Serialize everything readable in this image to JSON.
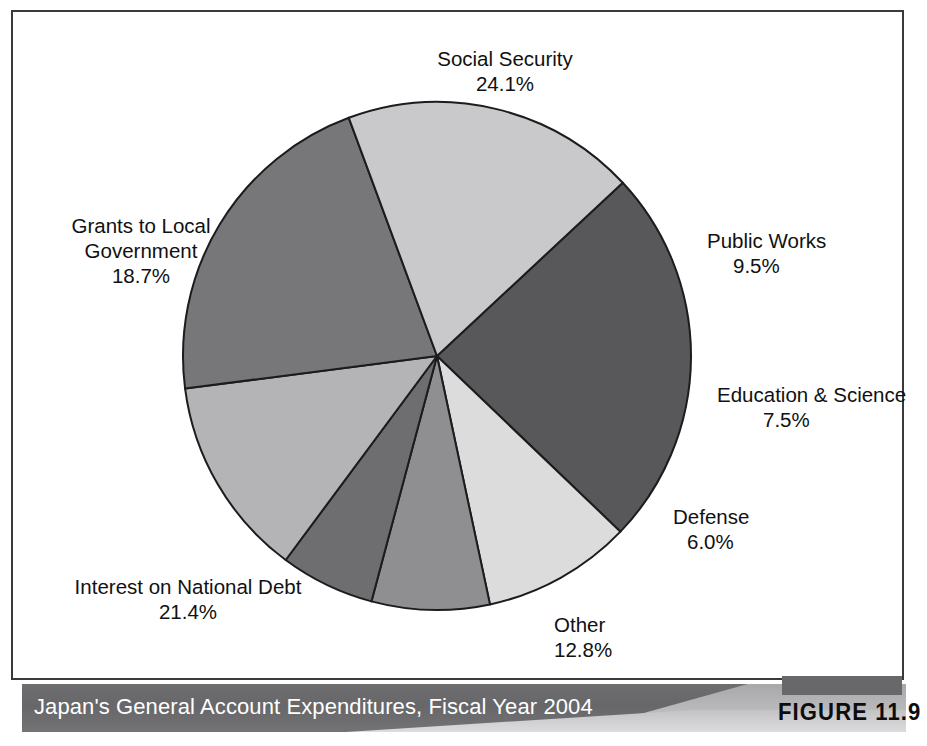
{
  "caption": {
    "title": "Japan's General Account Expenditures, Fiscal Year 2004",
    "figure_number": "FIGURE 11.9"
  },
  "labels": {
    "social_security": {
      "name": "Social Security",
      "pct": "24.1%"
    },
    "public_works": {
      "name": "Public Works",
      "pct": "9.5%"
    },
    "education": {
      "name": "Education & Science",
      "pct": "7.5%"
    },
    "defense": {
      "name": "Defense",
      "pct": "6.0%"
    },
    "other": {
      "name": "Other",
      "pct": "12.8%"
    },
    "interest": {
      "name": "Interest on National Debt",
      "pct": "21.4%"
    },
    "grants_line1": "Grants to Local",
    "grants_line2": "Government",
    "grants_pct": "18.7%"
  },
  "chart_data": {
    "type": "pie",
    "title": "Japan's General Account Expenditures, Fiscal Year 2004",
    "unit": "percent",
    "start_angle_deg": -43,
    "direction": "clockwise",
    "legend": "none-labels-outside",
    "categories": [
      "Social Security",
      "Public Works",
      "Education & Science",
      "Defense",
      "Other",
      "Interest on National Debt",
      "Grants to Local Government"
    ],
    "values": [
      24.1,
      9.5,
      7.5,
      6.0,
      12.8,
      21.4,
      18.7
    ],
    "labels": [
      "24.1%",
      "9.5%",
      "7.5%",
      "6.0%",
      "12.8%",
      "21.4%",
      "18.7%"
    ],
    "slice_colors": [
      "#58585b",
      "#dcdcdd",
      "#8f8f92",
      "#6e6e71",
      "#b4b4b7",
      "#77777a",
      "#c9c9cb"
    ],
    "slice_stroke": "#1c1c1e",
    "total": 100.0
  },
  "geometry": {
    "center_x": 424,
    "center_y": 344,
    "radius": 254
  },
  "colors": {
    "frame": "#3a3a3c",
    "caption_band": "#67676a",
    "caption_text": "#ffffff",
    "figure_tag_bar": "#68686b",
    "figure_tag_text": "#0d0d0d",
    "label_text": "#111111"
  }
}
